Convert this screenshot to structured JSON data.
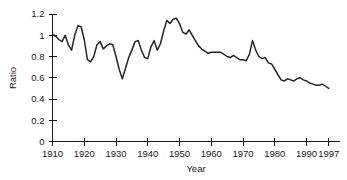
{
  "chart_data": {
    "type": "line",
    "title": "",
    "xlabel": "Year",
    "ylabel": "Ratio",
    "xlim": [
      1910,
      1997
    ],
    "ylim": [
      0,
      1.2
    ],
    "grid": false,
    "legend": null,
    "xticks": [
      1910,
      1920,
      1930,
      1940,
      1950,
      1960,
      1970,
      1980,
      1990,
      1997
    ],
    "xtick_labels": [
      "1910",
      "1920",
      "1930",
      "1940",
      "1950",
      "1960",
      "1970",
      "1980",
      "1990",
      "1997"
    ],
    "yticks": [
      0,
      0.2,
      0.4,
      0.6,
      0.8,
      1,
      1.2
    ],
    "ytick_labels": [
      "0",
      "0.2",
      "0.4",
      "0.6",
      "0.8",
      "1",
      "1.2"
    ],
    "line_color": "#262626",
    "series": [
      {
        "name": "Ratio",
        "x": [
          1910,
          1911,
          1912,
          1913,
          1914,
          1915,
          1916,
          1917,
          1918,
          1919,
          1920,
          1921,
          1922,
          1923,
          1924,
          1925,
          1926,
          1927,
          1928,
          1929,
          1930,
          1931,
          1932,
          1933,
          1934,
          1935,
          1936,
          1937,
          1938,
          1939,
          1940,
          1941,
          1942,
          1943,
          1944,
          1945,
          1946,
          1947,
          1948,
          1949,
          1950,
          1951,
          1952,
          1953,
          1954,
          1955,
          1956,
          1957,
          1958,
          1959,
          1960,
          1961,
          1962,
          1963,
          1964,
          1965,
          1966,
          1967,
          1968,
          1969,
          1970,
          1971,
          1972,
          1973,
          1974,
          1975,
          1976,
          1977,
          1978,
          1979,
          1980,
          1981,
          1982,
          1983,
          1984,
          1985,
          1986,
          1987,
          1988,
          1989,
          1990,
          1991,
          1992,
          1993,
          1994,
          1995,
          1996,
          1997
        ],
        "values": [
          1.01,
          0.99,
          0.96,
          0.94,
          1.0,
          0.91,
          0.86,
          1.0,
          1.09,
          1.08,
          0.96,
          0.77,
          0.75,
          0.8,
          0.91,
          0.94,
          0.87,
          0.9,
          0.92,
          0.91,
          0.8,
          0.68,
          0.59,
          0.69,
          0.79,
          0.86,
          0.94,
          0.95,
          0.86,
          0.79,
          0.78,
          0.89,
          0.95,
          0.86,
          0.92,
          1.04,
          1.14,
          1.11,
          1.15,
          1.16,
          1.11,
          1.03,
          1.01,
          1.05,
          1.0,
          0.95,
          0.9,
          0.87,
          0.85,
          0.83,
          0.84,
          0.84,
          0.84,
          0.84,
          0.82,
          0.8,
          0.79,
          0.81,
          0.79,
          0.77,
          0.77,
          0.76,
          0.82,
          0.95,
          0.86,
          0.8,
          0.78,
          0.79,
          0.74,
          0.73,
          0.68,
          0.63,
          0.58,
          0.57,
          0.59,
          0.58,
          0.57,
          0.59,
          0.6,
          0.58,
          0.57,
          0.55,
          0.54,
          0.53,
          0.53,
          0.54,
          0.52,
          0.5
        ]
      }
    ]
  },
  "labels": {
    "y_axis_title": "Ratio",
    "x_axis_title": "Year"
  }
}
